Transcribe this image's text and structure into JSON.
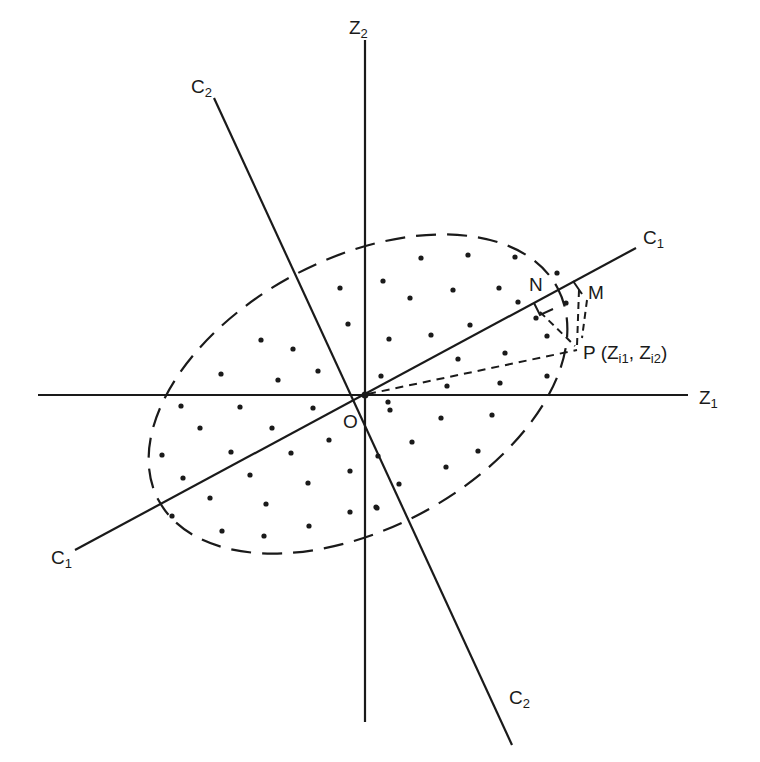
{
  "diagram": {
    "type": "principal-components-rotation",
    "origin": {
      "label": "O",
      "x": 365,
      "y": 395
    },
    "axes": [
      {
        "id": "z1",
        "label": "Z",
        "sub": "1",
        "x1": 38,
        "y1": 395,
        "x2": 688,
        "y2": 395
      },
      {
        "id": "z2",
        "label": "Z",
        "sub": "2",
        "x1": 365,
        "y1": 40,
        "x2": 365,
        "y2": 722
      },
      {
        "id": "c1",
        "label": "C",
        "sub": "1",
        "x1": 75,
        "y1": 550,
        "x2": 636,
        "y2": 248
      },
      {
        "id": "c2",
        "label": "C",
        "sub": "2",
        "x1": 214,
        "y1": 98,
        "x2": 512,
        "y2": 745
      }
    ],
    "ellipse": {
      "cx": 358,
      "cy": 394,
      "rx": 226,
      "ry": 135,
      "rotation": -28,
      "style": "dashed"
    },
    "points": {
      "N": {
        "label": "N",
        "x": 538,
        "y": 290
      },
      "M": {
        "label": "M",
        "x": 581,
        "y": 287
      },
      "P": {
        "label": "P",
        "x": 577,
        "y": 351,
        "coords_label": "(Z",
        "sub1": "i1",
        "sep": ", Z",
        "sub2": "i2",
        "close": ")"
      }
    },
    "labels": {
      "c1_top": {
        "text": "C",
        "sub": "1"
      },
      "c1_bottom": {
        "text": "C",
        "sub": "1"
      },
      "c2_top": {
        "text": "C",
        "sub": "2"
      },
      "c2_bottom": {
        "text": "C",
        "sub": "2"
      },
      "z1": {
        "text": "Z",
        "sub": "1"
      },
      "z2": {
        "text": "Z",
        "sub": "2"
      },
      "origin": {
        "text": "O"
      },
      "N": {
        "text": "N"
      },
      "M": {
        "text": "M"
      },
      "P": {
        "text": "P"
      },
      "P_coords_open": {
        "text": "(Z"
      },
      "P_sub1": {
        "text": "i1"
      },
      "P_sep": {
        "text": ", Z"
      },
      "P_sub2": {
        "text": "i2"
      },
      "P_close": {
        "text": ")"
      }
    },
    "scatter_dots": [
      [
        383,
        281
      ],
      [
        340,
        288
      ],
      [
        348,
        324
      ],
      [
        389,
        339
      ],
      [
        261,
        340
      ],
      [
        293,
        349
      ],
      [
        221,
        374
      ],
      [
        278,
        380
      ],
      [
        318,
        371
      ],
      [
        381,
        376
      ],
      [
        181,
        406
      ],
      [
        240,
        407
      ],
      [
        313,
        408
      ],
      [
        200,
        428
      ],
      [
        272,
        428
      ],
      [
        329,
        440
      ],
      [
        162,
        455
      ],
      [
        231,
        452
      ],
      [
        291,
        453
      ],
      [
        350,
        471
      ],
      [
        183,
        478
      ],
      [
        250,
        475
      ],
      [
        308,
        483
      ],
      [
        210,
        498
      ],
      [
        266,
        504
      ],
      [
        350,
        512
      ],
      [
        376,
        507
      ],
      [
        172,
        516
      ],
      [
        222,
        531
      ],
      [
        309,
        526
      ],
      [
        264,
        536
      ],
      [
        378,
        456
      ],
      [
        388,
        402
      ],
      [
        421,
        258
      ],
      [
        468,
        255
      ],
      [
        515,
        257
      ],
      [
        410,
        298
      ],
      [
        453,
        290
      ],
      [
        499,
        288
      ],
      [
        557,
        273
      ],
      [
        518,
        302
      ],
      [
        566,
        303
      ],
      [
        431,
        335
      ],
      [
        470,
        325
      ],
      [
        547,
        336
      ],
      [
        458,
        359
      ],
      [
        505,
        353
      ],
      [
        447,
        386
      ],
      [
        500,
        383
      ],
      [
        547,
        376
      ],
      [
        390,
        410
      ],
      [
        441,
        418
      ],
      [
        492,
        415
      ],
      [
        412,
        442
      ],
      [
        478,
        451
      ],
      [
        446,
        467
      ],
      [
        399,
        484
      ],
      [
        377,
        508
      ],
      [
        536,
        318
      ]
    ]
  }
}
